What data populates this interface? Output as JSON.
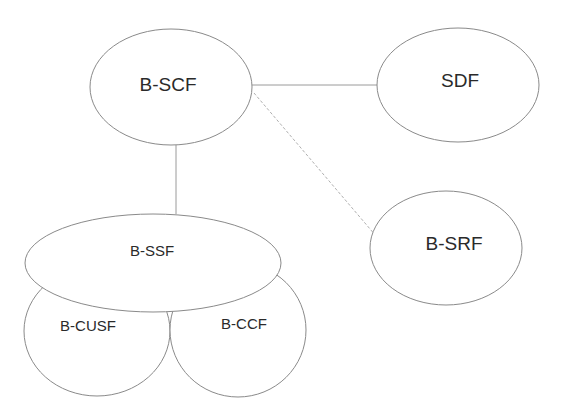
{
  "diagram": {
    "nodes": {
      "bscf": {
        "label": "B-SCF"
      },
      "sdf": {
        "label": "SDF"
      },
      "bsrf": {
        "label": "B-SRF"
      },
      "bssf": {
        "label": "B-SSF"
      },
      "bcusf": {
        "label": "B-CUSF"
      },
      "bccf": {
        "label": "B-CCF"
      }
    },
    "edges": [
      {
        "from": "B-SCF",
        "to": "SDF",
        "style": "solid"
      },
      {
        "from": "B-SCF",
        "to": "B-SRF",
        "style": "dashed"
      },
      {
        "from": "B-SCF",
        "to": "B-SSF",
        "style": "solid"
      }
    ],
    "colors": {
      "stroke": "#8a8a8a",
      "text": "#2a2a2a",
      "background": "#ffffff"
    }
  }
}
